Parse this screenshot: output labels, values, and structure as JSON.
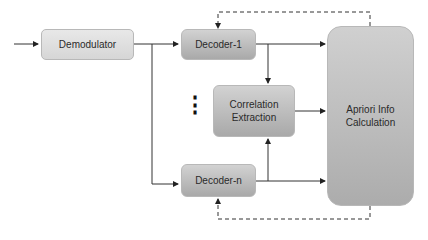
{
  "diagram": {
    "nodes": {
      "demodulator": "Demodulator",
      "decoder_1": "Decoder-1",
      "decoder_n": "Decoder-n",
      "correlation_1": "Correlation",
      "correlation_2": "Extraction",
      "apriori_1": "Apriori Info",
      "apriori_2": "Calculation"
    },
    "ellipsis": "⋮",
    "edges": [
      {
        "from": "input",
        "to": "Demodulator",
        "style": "solid"
      },
      {
        "from": "Demodulator",
        "to": "Decoder-1",
        "style": "solid"
      },
      {
        "from": "Demodulator",
        "to": "Decoder-n",
        "style": "solid"
      },
      {
        "from": "Decoder-1",
        "to": "Correlation Extraction",
        "style": "solid"
      },
      {
        "from": "Decoder-1",
        "to": "Apriori Info Calculation",
        "style": "solid"
      },
      {
        "from": "Decoder-n",
        "to": "Correlation Extraction",
        "style": "solid"
      },
      {
        "from": "Decoder-n",
        "to": "Apriori Info Calculation",
        "style": "solid"
      },
      {
        "from": "Correlation Extraction",
        "to": "Apriori Info Calculation",
        "style": "solid"
      },
      {
        "from": "Apriori Info Calculation",
        "to": "Decoder-1",
        "style": "dashed"
      },
      {
        "from": "Apriori Info Calculation",
        "to": "Decoder-n",
        "style": "dashed"
      }
    ]
  }
}
